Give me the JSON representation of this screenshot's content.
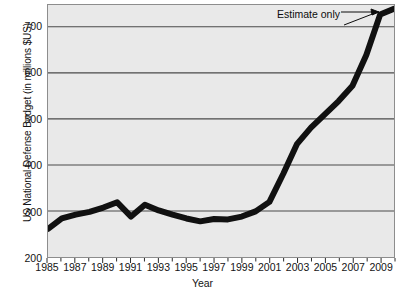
{
  "chart_data": {
    "type": "line",
    "title": "",
    "xlabel": "Year",
    "ylabel": "US National Defense Budget (in millions $US)",
    "xlim": [
      1985,
      2010
    ],
    "ylim": [
      200,
      730
    ],
    "ytick_labels": [
      "200",
      "300",
      "400",
      "500",
      "600",
      "700"
    ],
    "ytick_values": [
      200,
      300,
      400,
      500,
      600,
      700
    ],
    "xtick_labels": [
      "1985",
      "1987",
      "1989",
      "1991",
      "1993",
      "1995",
      "1997",
      "1999",
      "2001",
      "2003",
      "2005",
      "2007",
      "2009"
    ],
    "xtick_values": [
      1985,
      1987,
      1989,
      1991,
      1993,
      1995,
      1997,
      1999,
      2001,
      2003,
      2005,
      2007,
      2009
    ],
    "minor_xticks": [
      1986,
      1988,
      1990,
      1992,
      1994,
      1996,
      1998,
      2000,
      2002,
      2004,
      2006,
      2008,
      2010
    ],
    "grid": "horizontal",
    "legend": "none",
    "line_color": "#111111",
    "line_width": 6,
    "plot_background": "#e9e9e9",
    "x": [
      1985,
      1986,
      1987,
      1988,
      1989,
      1990,
      1991,
      1992,
      1993,
      1994,
      1995,
      1996,
      1997,
      1998,
      1999,
      2000,
      2001,
      2002,
      2003,
      2004,
      2005,
      2006,
      2007,
      2008,
      2009,
      2010
    ],
    "values": [
      259,
      281,
      289,
      295,
      304,
      315,
      285,
      310,
      298,
      289,
      281,
      275,
      280,
      279,
      285,
      296,
      316,
      375,
      438,
      472,
      500,
      528,
      560,
      625,
      710,
      722
    ],
    "series": [
      {
        "name": "US National Defense Budget",
        "values": [
          259,
          281,
          289,
          295,
          304,
          315,
          285,
          310,
          298,
          289,
          281,
          275,
          280,
          279,
          285,
          296,
          316,
          375,
          438,
          472,
          500,
          528,
          560,
          625,
          710,
          722
        ]
      }
    ],
    "annotations": [
      {
        "text": "Estimate only",
        "points_to_year": 2010,
        "points_to_value": 722
      }
    ]
  },
  "axes": {
    "y_title": "US National Defense Budget (in millions $US)",
    "x_title": "Year"
  },
  "annotation": {
    "estimate_label": "Estimate only"
  }
}
